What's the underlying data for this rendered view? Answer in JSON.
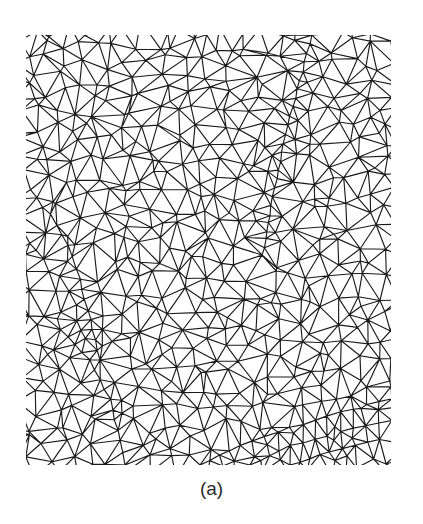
{
  "figure": {
    "caption": "(a)",
    "mesh": {
      "bounds": {
        "left": 26,
        "top": 35,
        "right": 391,
        "bottom": 465
      },
      "grid_spacing": 19,
      "jitter": 0.42,
      "seed": 7,
      "stroke_color": "#1a1a1a",
      "stroke_width": 1.15,
      "background": "#ffffff",
      "feature_lines": [
        {
          "name": "upper-right-ridge",
          "points": [
            [
              312,
              36
            ],
            [
              300,
              80
            ],
            [
              288,
              125
            ],
            [
              278,
              170
            ],
            [
              270,
              215
            ],
            [
              262,
              255
            ]
          ],
          "spacing": 9
        },
        {
          "name": "lower-right-sweep-1",
          "points": [
            [
              391,
              398
            ],
            [
              340,
              412
            ],
            [
              290,
              428
            ],
            [
              240,
              446
            ],
            [
              200,
              465
            ]
          ],
          "spacing": 12
        },
        {
          "name": "lower-right-sweep-2",
          "points": [
            [
              391,
              420
            ],
            [
              340,
              432
            ],
            [
              290,
              446
            ],
            [
              250,
              465
            ]
          ],
          "spacing": 12
        },
        {
          "name": "lower-right-sweep-3",
          "points": [
            [
              380,
              440
            ],
            [
              330,
              452
            ],
            [
              290,
              465
            ]
          ],
          "spacing": 12
        },
        {
          "name": "left-fold",
          "points": [
            [
              30,
              190
            ],
            [
              50,
              215
            ],
            [
              68,
              245
            ],
            [
              80,
              280
            ],
            [
              90,
              320
            ],
            [
              100,
              360
            ]
          ],
          "spacing": 11
        },
        {
          "name": "lower-left-fold",
          "points": [
            [
              60,
              330
            ],
            [
              90,
              360
            ],
            [
              110,
              400
            ],
            [
              120,
              440
            ],
            [
              125,
              465
            ]
          ],
          "spacing": 11
        }
      ]
    }
  }
}
